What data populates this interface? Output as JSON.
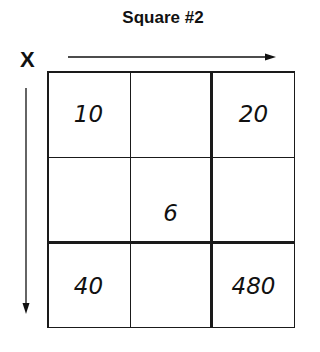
{
  "title": "Square #2",
  "axis_label": "X",
  "grid": {
    "rows": [
      [
        "10",
        "",
        "20"
      ],
      [
        "",
        "6",
        ""
      ],
      [
        "40",
        "",
        "480"
      ]
    ]
  },
  "arrows": {
    "horizontal": "right-arrow",
    "vertical": "down-arrow"
  }
}
